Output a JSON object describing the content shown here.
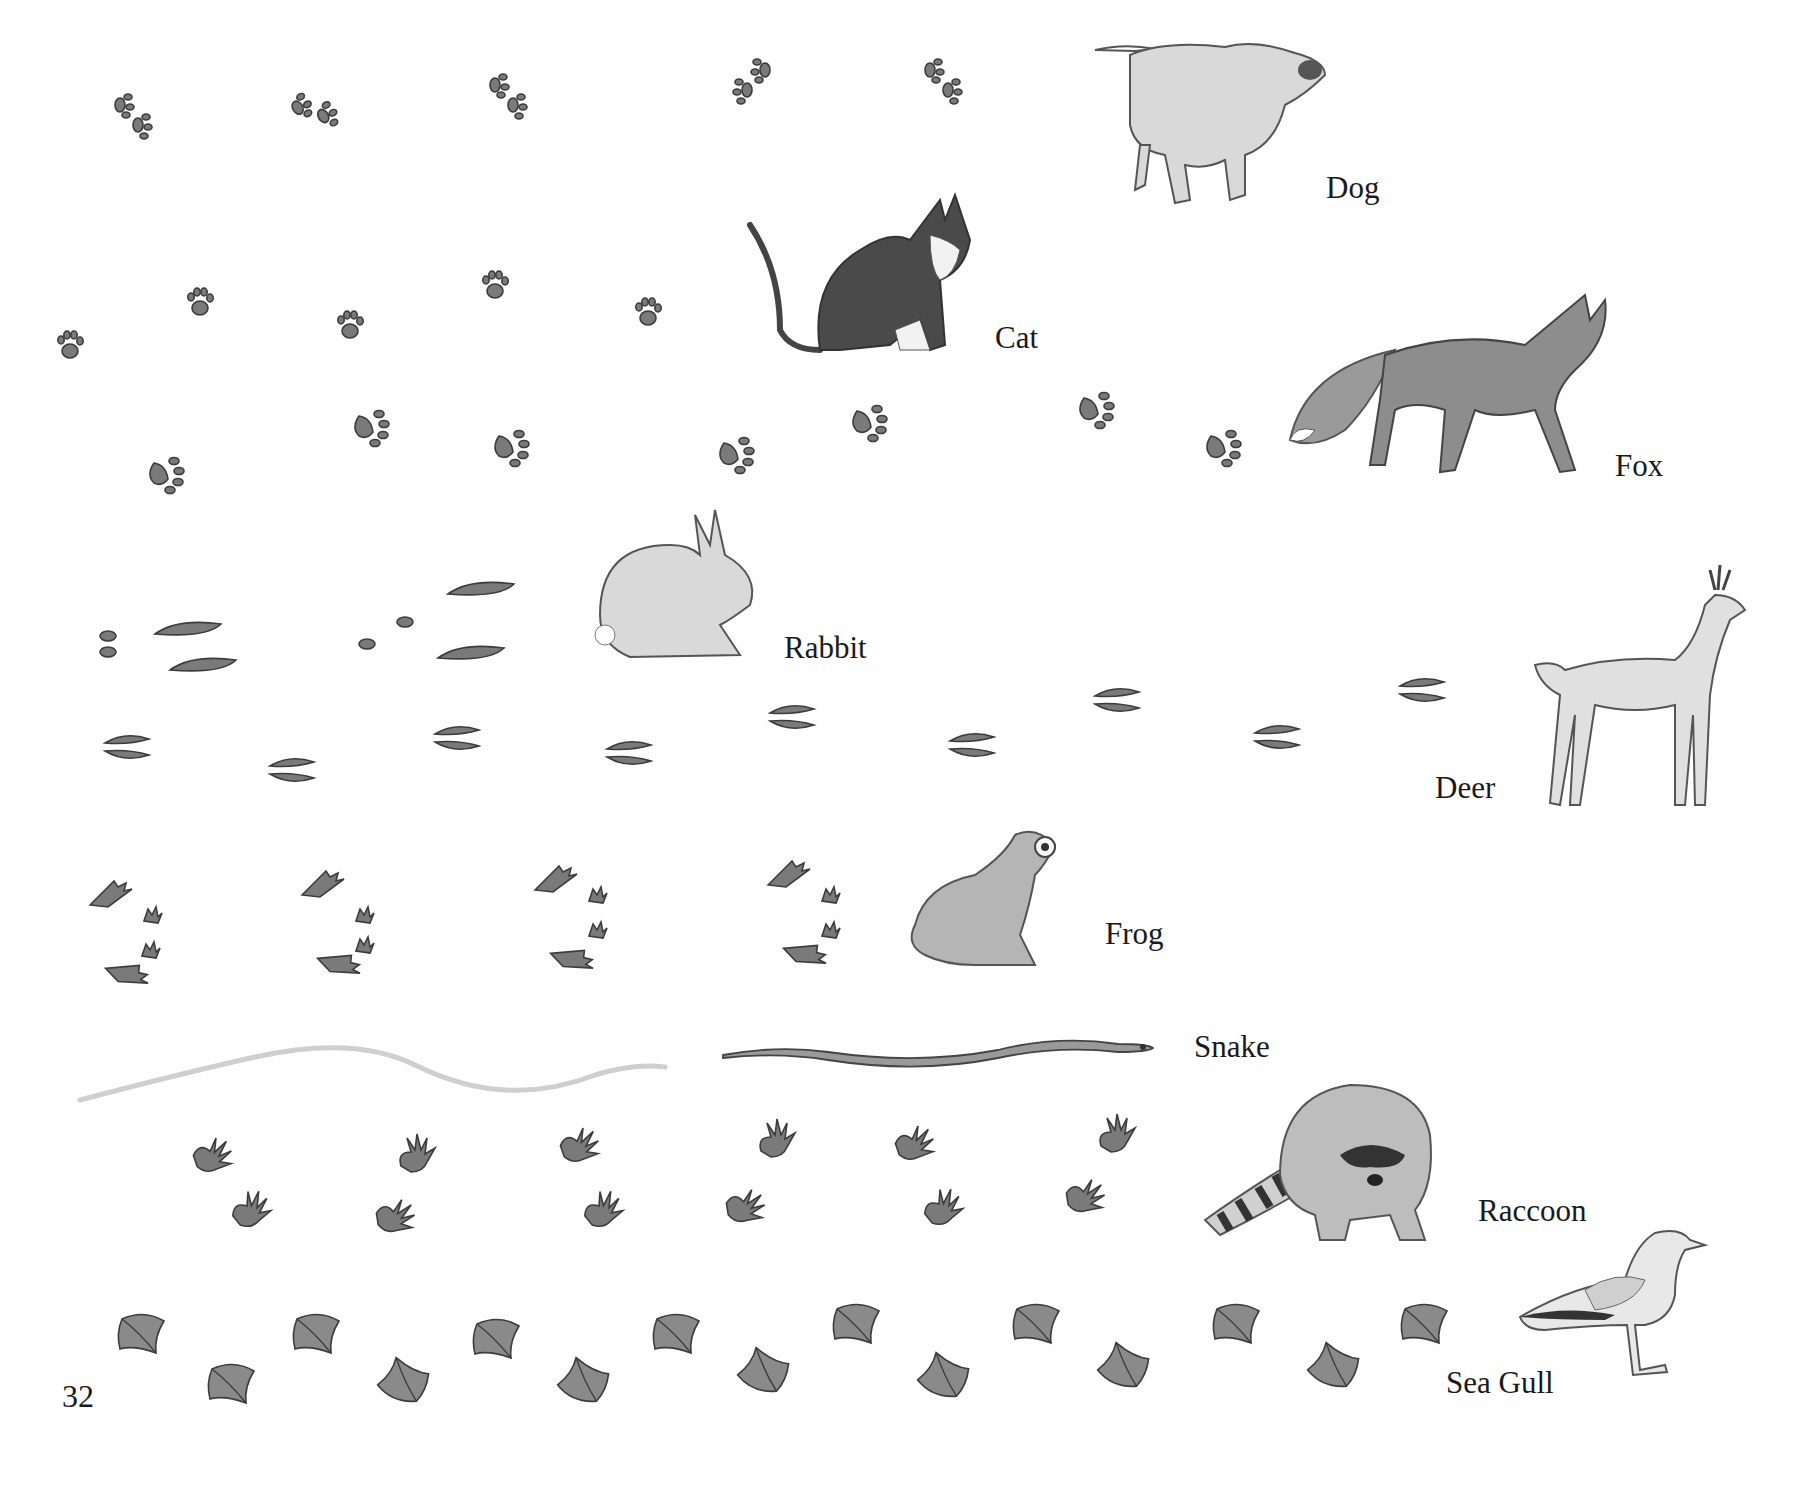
{
  "page": {
    "number": "32",
    "background": "#fefefe",
    "print_color": "#7a7a7a",
    "outline_color": "#3c3c3c"
  },
  "animals": [
    {
      "id": "dog",
      "label": "Dog",
      "track_count": 5
    },
    {
      "id": "cat",
      "label": "Cat",
      "track_count": 6
    },
    {
      "id": "fox",
      "label": "Fox",
      "track_count": 8
    },
    {
      "id": "rabbit",
      "label": "Rabbit",
      "track_count": 3
    },
    {
      "id": "deer",
      "label": "Deer",
      "track_count": 9
    },
    {
      "id": "frog",
      "label": "Frog",
      "track_count": 4
    },
    {
      "id": "snake",
      "label": "Snake",
      "track_count": 2
    },
    {
      "id": "raccoon",
      "label": "Raccoon",
      "track_count": 12
    },
    {
      "id": "sea_gull",
      "label": "Sea Gull",
      "track_count": 15
    }
  ]
}
